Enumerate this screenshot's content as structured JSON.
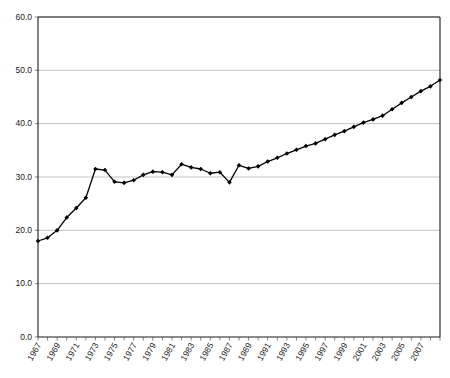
{
  "chart_data": {
    "type": "line",
    "title": "",
    "subtitle": "",
    "xlabel": "",
    "ylabel": "",
    "ylim": [
      0.0,
      60.0
    ],
    "xlim": [
      1967,
      2009
    ],
    "yticks": [
      "0.0",
      "10.0",
      "20.0",
      "30.0",
      "40.0",
      "50.0",
      "60.0"
    ],
    "ytick_values": [
      0.0,
      10.0,
      20.0,
      30.0,
      40.0,
      50.0,
      60.0
    ],
    "xtick_labels": [
      "1967",
      "1969",
      "1971",
      "1973",
      "1975",
      "1977",
      "1979",
      "1981",
      "1983",
      "1985",
      "1987",
      "1989",
      "1991",
      "1993",
      "1995",
      "1997",
      "1999",
      "2001",
      "2003",
      "2005",
      "2007"
    ],
    "grid": "horizontal",
    "legend": "none",
    "marker": "diamond",
    "line_color": "#000000",
    "grid_color": "#b4b4b4",
    "axis_color": "#1a1a1a",
    "x": [
      1967,
      1968,
      1969,
      1970,
      1971,
      1972,
      1973,
      1974,
      1975,
      1976,
      1977,
      1978,
      1979,
      1980,
      1981,
      1982,
      1983,
      1984,
      1985,
      1986,
      1987,
      1988,
      1989,
      1990,
      1991,
      1992,
      1993,
      1994,
      1995,
      1996,
      1997,
      1998,
      1999,
      2000,
      2001,
      2002,
      2003,
      2004,
      2005,
      2006,
      2007,
      2008,
      2009
    ],
    "values": [
      18.0,
      18.6,
      20.0,
      22.4,
      24.2,
      26.1,
      31.5,
      31.3,
      29.1,
      28.9,
      29.4,
      30.4,
      31.0,
      30.9,
      30.4,
      32.4,
      31.8,
      31.5,
      30.7,
      30.9,
      29.0,
      32.2,
      31.6,
      32.0,
      32.9,
      33.6,
      34.4,
      35.1,
      35.8,
      36.3,
      37.1,
      37.9,
      38.6,
      39.4,
      40.2,
      40.8,
      41.5,
      42.7,
      43.9,
      45.0,
      46.1,
      47.0,
      48.2
    ],
    "series_name": ""
  }
}
